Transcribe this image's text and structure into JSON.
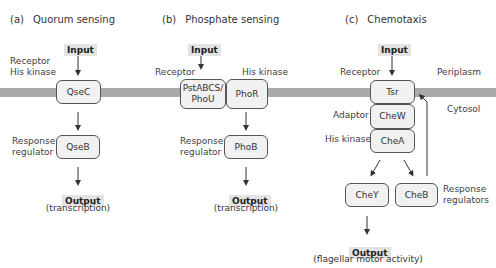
{
  "membrane": {
    "color": "#a9a9a9"
  },
  "panels": [
    {
      "letter": "(a)",
      "title": "Quorum sensing",
      "input_label": "Input",
      "receptor_label_line1": "Receptor",
      "receptor_label_line2": "His kinase",
      "receptor_box": "QseC",
      "regulator_label_line1": "Response",
      "regulator_label_line2": "regulator",
      "regulator_box": "QseB",
      "output_label": "Output",
      "output_detail": "(transcription)"
    },
    {
      "letter": "(b)",
      "title": "Phosphate sensing",
      "input_label": "Input",
      "receptor_label": "Receptor",
      "kinase_label": "His kinase",
      "receptor_box_line1": "PstABCS/",
      "receptor_box_line2": "PhoU",
      "kinase_box": "PhoR",
      "regulator_label_line1": "Response",
      "regulator_label_line2": "regulator",
      "regulator_box": "PhoB",
      "output_label": "Output",
      "output_detail": "(transcription)"
    },
    {
      "letter": "(c)",
      "title": "Chemotaxis",
      "input_label": "Input",
      "receptor_label": "Receptor",
      "periplasm_label": "Periplasm",
      "cytosol_label": "Cytosol",
      "receptor_box": "Tsr",
      "adaptor_label": "Adaptor",
      "adaptor_box": "CheW",
      "kinase_label": "His kinase",
      "kinase_box": "CheA",
      "regulator_box_1": "CheY",
      "regulator_box_2": "CheB",
      "regulators_label_line1": "Response",
      "regulators_label_line2": "regulators",
      "output_label": "Output",
      "output_detail": "(flagellar motor activity)"
    }
  ]
}
